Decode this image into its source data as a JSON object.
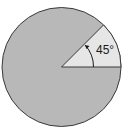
{
  "diagram": {
    "type": "circle-sector",
    "angle_label": "45°",
    "angle_degrees": 45,
    "colors": {
      "circle_fill": "#b8b8b8",
      "sector_fill": "#e6e6e6",
      "stroke": "#3a3a3a",
      "background": "#ffffff"
    }
  }
}
